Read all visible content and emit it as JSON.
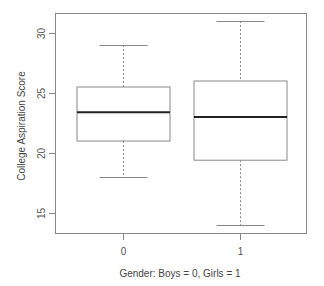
{
  "chart_data": {
    "type": "boxplot",
    "title": "",
    "xlabel": "Gender: Boys = 0, Girls = 1",
    "ylabel": "College Aspiration Score",
    "categories": [
      "0",
      "1"
    ],
    "ylim": [
      13.3,
      31.8
    ],
    "yticks": [
      15,
      20,
      25,
      30
    ],
    "grid": false,
    "legend": null,
    "boxes": [
      {
        "category": "0",
        "whisker_low": 18,
        "q1": 21,
        "median": 23.4,
        "q3": 25.5,
        "whisker_high": 29
      },
      {
        "category": "1",
        "whisker_low": 14,
        "q1": 19.4,
        "median": 23,
        "q3": 26,
        "whisker_high": 31
      }
    ],
    "colors": {
      "box": "#888888",
      "median": "#222222",
      "axis": "#888888",
      "whisker": "#888888"
    }
  }
}
